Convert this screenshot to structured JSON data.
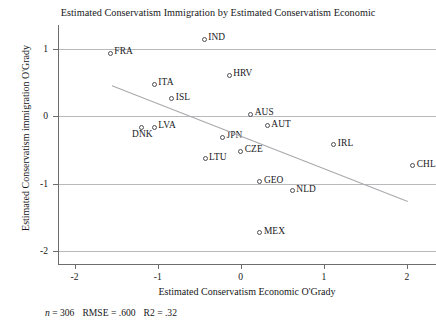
{
  "chart_data": {
    "type": "scatter",
    "title": "Estimated Conservatism Immigration by Estimated Conservatism Economic",
    "xlabel": "Estimated Conservatism Economic O'Grady",
    "ylabel": "Estimated Conservatism immigration O'Grady",
    "xlim": [
      -2.2,
      2.35
    ],
    "ylim": [
      -2.2,
      1.35
    ],
    "xticks": [
      "-2",
      "-1",
      "0",
      "1",
      "2"
    ],
    "xtick_values": [
      -2,
      -1,
      0,
      1,
      2
    ],
    "yticks": [
      "1",
      "0",
      "-1",
      "-2"
    ],
    "ytick_values": [
      1,
      0,
      -1,
      -2
    ],
    "grid": "horizontal",
    "legend": "none",
    "points": [
      {
        "label": "IND",
        "x": -0.44,
        "y": 1.14,
        "label_pos": "right"
      },
      {
        "label": "FRA",
        "x": -1.57,
        "y": 0.93,
        "label_pos": "right"
      },
      {
        "label": "HRV",
        "x": -0.14,
        "y": 0.61,
        "label_pos": "right"
      },
      {
        "label": "ITA",
        "x": -1.04,
        "y": 0.47,
        "label_pos": "right"
      },
      {
        "label": "ISL",
        "x": -0.83,
        "y": 0.26,
        "label_pos": "right"
      },
      {
        "label": "AUS",
        "x": 0.12,
        "y": 0.03,
        "label_pos": "right"
      },
      {
        "label": "AUT",
        "x": 0.32,
        "y": -0.14,
        "label_pos": "right"
      },
      {
        "label": "DNK",
        "x": -1.2,
        "y": -0.16,
        "label_pos": "below"
      },
      {
        "label": "LVA",
        "x": -1.04,
        "y": -0.16,
        "label_pos": "right"
      },
      {
        "label": "JPN",
        "x": -0.22,
        "y": -0.31,
        "label_pos": "right"
      },
      {
        "label": "CZE",
        "x": 0.0,
        "y": -0.52,
        "label_pos": "right"
      },
      {
        "label": "LTU",
        "x": -0.43,
        "y": -0.63,
        "label_pos": "right"
      },
      {
        "label": "IRL",
        "x": 1.12,
        "y": -0.42,
        "label_pos": "right"
      },
      {
        "label": "CHL",
        "x": 2.07,
        "y": -0.73,
        "label_pos": "right"
      },
      {
        "label": "GEO",
        "x": 0.23,
        "y": -0.97,
        "label_pos": "right"
      },
      {
        "label": "NLD",
        "x": 0.62,
        "y": -1.1,
        "label_pos": "right"
      },
      {
        "label": "MEX",
        "x": 0.23,
        "y": -1.72,
        "label_pos": "right"
      }
    ],
    "fit_line": {
      "x_start": -1.55,
      "y_start": 0.45,
      "x_end": 2.01,
      "y_end": -1.26
    },
    "footnote": {
      "n_symbol": "n",
      "n_text": " = 306",
      "rmse_text": "RMSE = .600",
      "r2_text": "R2 = .32"
    }
  }
}
